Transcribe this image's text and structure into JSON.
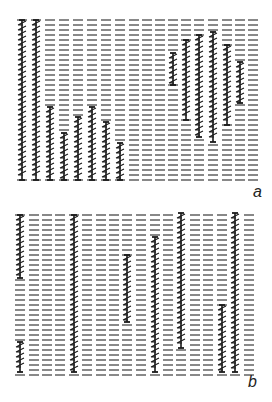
{
  "figure": {
    "colors": {
      "dash": "#6b6b6b",
      "stroke": "#1a1a1a"
    },
    "row_spacing": 5,
    "dash_width": 10,
    "panels": [
      {
        "label": "a",
        "label_pos": [
          253,
          195
        ],
        "top": 20,
        "bottom": 180,
        "columns_x": [
          22,
          36,
          50,
          64,
          78,
          92,
          106,
          120,
          134,
          147,
          160,
          173,
          186,
          199,
          213,
          227,
          240,
          253
        ],
        "strands": [
          {
            "col": 0,
            "y1": 20,
            "y2": 180
          },
          {
            "col": 1,
            "y1": 20,
            "y2": 180
          },
          {
            "col": 2,
            "y1": 107,
            "y2": 180
          },
          {
            "col": 3,
            "y1": 133,
            "y2": 180
          },
          {
            "col": 4,
            "y1": 117,
            "y2": 180
          },
          {
            "col": 5,
            "y1": 107,
            "y2": 180
          },
          {
            "col": 6,
            "y1": 122,
            "y2": 180
          },
          {
            "col": 7,
            "y1": 143,
            "y2": 180
          },
          {
            "col": 11,
            "y1": 53,
            "y2": 85
          },
          {
            "col": 12,
            "y1": 40,
            "y2": 120
          },
          {
            "col": 13,
            "y1": 35,
            "y2": 137
          },
          {
            "col": 14,
            "y1": 32,
            "y2": 142
          },
          {
            "col": 15,
            "y1": 45,
            "y2": 125
          },
          {
            "col": 16,
            "y1": 62,
            "y2": 103
          }
        ]
      },
      {
        "label": "b",
        "label_pos": [
          248,
          385
        ],
        "top": 215,
        "bottom": 378,
        "columns_x": [
          20,
          34,
          47,
          60,
          74,
          87,
          101,
          114,
          127,
          141,
          155,
          168,
          181,
          195,
          208,
          222,
          235,
          249
        ],
        "strands": [
          {
            "col": 0,
            "y1": 215,
            "y2": 278
          },
          {
            "col": 0,
            "y1": 342,
            "y2": 372
          },
          {
            "col": 4,
            "y1": 215,
            "y2": 372
          },
          {
            "col": 8,
            "y1": 255,
            "y2": 322
          },
          {
            "col": 10,
            "y1": 237,
            "y2": 372
          },
          {
            "col": 12,
            "y1": 213,
            "y2": 348
          },
          {
            "col": 15,
            "y1": 305,
            "y2": 372
          },
          {
            "col": 16,
            "y1": 213,
            "y2": 372
          }
        ]
      }
    ]
  }
}
